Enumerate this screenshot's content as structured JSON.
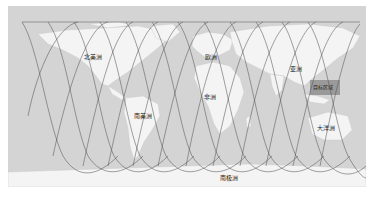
{
  "map": {
    "type": "world-map-satellite-ground-tracks",
    "projection": "equirectangular",
    "colors": {
      "ocean": "#d4d4d4",
      "land": "#f4f4f4",
      "track": "#555555",
      "highlight": "#9a9a9a",
      "border": "#ffffff"
    },
    "labels": [
      {
        "id": "north-america",
        "text": "北美洲"
      },
      {
        "id": "europe",
        "text": "欧洲"
      },
      {
        "id": "asia",
        "text": "亚洲"
      },
      {
        "id": "africa",
        "text": "非洲"
      },
      {
        "id": "south-america",
        "text": "南美洲"
      },
      {
        "id": "oceania",
        "text": "大洋洲"
      },
      {
        "id": "antarctica",
        "text": "南极洲"
      }
    ],
    "highlight_region": {
      "text": "目标区域"
    },
    "track_count": 12
  }
}
